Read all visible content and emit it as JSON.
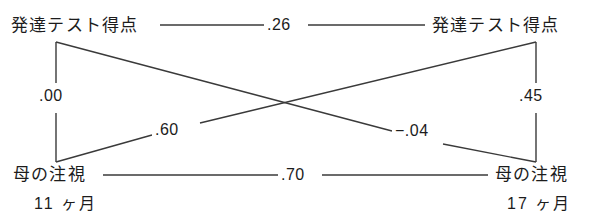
{
  "diagram": {
    "type": "cross-lagged-panel-path-diagram",
    "nodes": {
      "top_left": {
        "label": "発達テスト得点"
      },
      "top_right": {
        "label": "発達テスト得点"
      },
      "bottom_left": {
        "label": "母の注視"
      },
      "bottom_right": {
        "label": "母の注視"
      }
    },
    "time_labels": {
      "left": "11 ヶ月",
      "right": "17 ヶ月"
    },
    "coefficients": {
      "top_horizontal": ".26",
      "bottom_horizontal": ".70",
      "left_vertical": ".00",
      "right_vertical": ".45",
      "diagonal_down": ".60",
      "diagonal_up": "−.04"
    },
    "colors": {
      "line": "#3a3a3a",
      "text": "#1c1c1c",
      "background": "#ffffff"
    }
  }
}
